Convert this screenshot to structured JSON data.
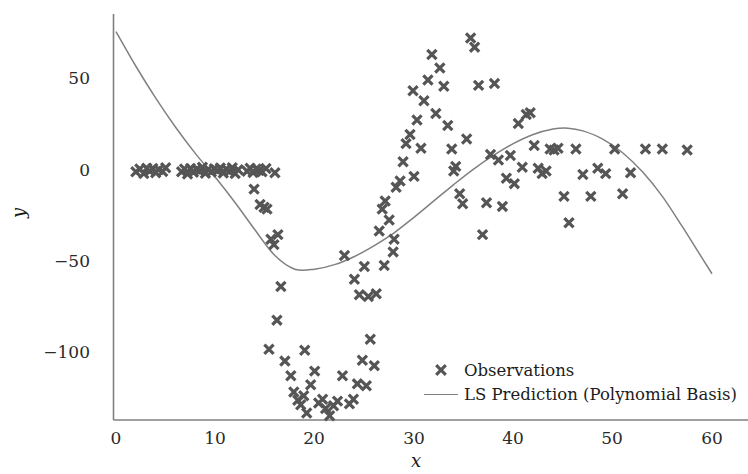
{
  "chart_data": {
    "type": "scatter",
    "title": "",
    "xlabel": "x",
    "ylabel": "y",
    "xlim": [
      -2.5,
      62
    ],
    "ylim": [
      -142,
      82
    ],
    "xticks": [
      0,
      10,
      20,
      30,
      40,
      50,
      60
    ],
    "xtick_labels": [
      "0",
      "10",
      "20",
      "30",
      "40",
      "50",
      "60"
    ],
    "yticks": [
      50,
      0,
      -50,
      -100
    ],
    "ytick_labels": [
      "50",
      "0",
      "−50",
      "−100"
    ],
    "grid": false,
    "legend_position": "lower right",
    "marker_color": "#555555",
    "line_color": "#808080",
    "axis_color": "#808080",
    "text_color": "#1c1c1c",
    "series": [
      {
        "name": "Observations",
        "type": "scatter",
        "marker": "x",
        "points": [
          [
            2.0,
            -1.0
          ],
          [
            2.4,
            0.5
          ],
          [
            2.8,
            -2.0
          ],
          [
            3.1,
            1.0
          ],
          [
            3.4,
            -0.5
          ],
          [
            3.7,
            0.8
          ],
          [
            4.0,
            -1.5
          ],
          [
            4.3,
            0.2
          ],
          [
            4.7,
            -0.8
          ],
          [
            5.0,
            1.2
          ],
          [
            6.6,
            -1.0
          ],
          [
            6.9,
            0.6
          ],
          [
            7.2,
            -2.2
          ],
          [
            7.5,
            0.9
          ],
          [
            7.8,
            -1.2
          ],
          [
            8.1,
            0.4
          ],
          [
            8.4,
            -0.6
          ],
          [
            8.7,
            1.5
          ],
          [
            9.0,
            -1.8
          ],
          [
            9.3,
            0.3
          ],
          [
            9.6,
            -1.1
          ],
          [
            9.9,
            0.7
          ],
          [
            10.2,
            -0.4
          ],
          [
            10.5,
            1.1
          ],
          [
            10.8,
            -1.6
          ],
          [
            11.1,
            0.5
          ],
          [
            11.4,
            -0.9
          ],
          [
            11.7,
            1.3
          ],
          [
            12.0,
            -2.0
          ],
          [
            12.3,
            0.1
          ],
          [
            13.2,
            -0.7
          ],
          [
            13.5,
            1.0
          ],
          [
            13.8,
            -1.4
          ],
          [
            14.1,
            0.6
          ],
          [
            14.4,
            -0.3
          ],
          [
            14.7,
            -1.0
          ],
          [
            15.1,
            0.8
          ],
          [
            16.0,
            -1.5
          ],
          [
            13.9,
            -10.5
          ],
          [
            14.5,
            -19.0
          ],
          [
            14.9,
            -20.5
          ],
          [
            15.2,
            -21.5
          ],
          [
            15.6,
            -38.0
          ],
          [
            15.9,
            -41.0
          ],
          [
            16.3,
            -35.5
          ],
          [
            16.6,
            -64.0
          ],
          [
            16.2,
            -82.5
          ],
          [
            15.4,
            -98.5
          ],
          [
            17.0,
            -105.0
          ],
          [
            17.6,
            -113.0
          ],
          [
            17.9,
            -122.0
          ],
          [
            18.3,
            -126.5
          ],
          [
            18.6,
            -129.0
          ],
          [
            18.9,
            -124.0
          ],
          [
            19.2,
            -133.5
          ],
          [
            19.6,
            -118.0
          ],
          [
            20.4,
            -128.0
          ],
          [
            20.8,
            -126.0
          ],
          [
            21.1,
            -131.0
          ],
          [
            21.5,
            -135.0
          ],
          [
            21.9,
            -129.5
          ],
          [
            22.3,
            -127.0
          ],
          [
            20.0,
            -110.5
          ],
          [
            22.8,
            -113.0
          ],
          [
            23.5,
            -128.5
          ],
          [
            23.9,
            -126.0
          ],
          [
            24.3,
            -117.5
          ],
          [
            19.0,
            -99.0
          ],
          [
            24.8,
            -104.5
          ],
          [
            25.2,
            -118.5
          ],
          [
            25.6,
            -93.0
          ],
          [
            26.0,
            -107.5
          ],
          [
            23.0,
            -47.0
          ],
          [
            24.0,
            -60.0
          ],
          [
            24.5,
            -68.5
          ],
          [
            25.4,
            -69.5
          ],
          [
            25.0,
            -53.0
          ],
          [
            26.5,
            -33.5
          ],
          [
            26.8,
            -21.5
          ],
          [
            27.1,
            -17.0
          ],
          [
            27.5,
            -27.5
          ],
          [
            27.9,
            -45.0
          ],
          [
            28.2,
            -9.5
          ],
          [
            28.6,
            -6.0
          ],
          [
            28.9,
            4.5
          ],
          [
            29.2,
            14.5
          ],
          [
            29.6,
            19.5
          ],
          [
            29.9,
            43.5
          ],
          [
            30.3,
            27.5
          ],
          [
            30.7,
            12.0
          ],
          [
            31.0,
            38.0
          ],
          [
            31.4,
            49.5
          ],
          [
            31.8,
            63.5
          ],
          [
            32.2,
            31.0
          ],
          [
            32.6,
            56.0
          ],
          [
            33.0,
            46.0
          ],
          [
            33.4,
            24.5
          ],
          [
            33.8,
            11.5
          ],
          [
            34.2,
            2.0
          ],
          [
            34.6,
            -13.0
          ],
          [
            34.9,
            -18.5
          ],
          [
            35.3,
            17.0
          ],
          [
            35.7,
            72.5
          ],
          [
            36.1,
            67.5
          ],
          [
            36.5,
            46.5
          ],
          [
            36.9,
            -35.5
          ],
          [
            37.3,
            -18.0
          ],
          [
            37.7,
            8.5
          ],
          [
            38.1,
            47.5
          ],
          [
            38.5,
            5.5
          ],
          [
            38.9,
            -20.0
          ],
          [
            39.3,
            -4.5
          ],
          [
            39.7,
            8.0
          ],
          [
            40.1,
            -7.5
          ],
          [
            40.5,
            25.5
          ],
          [
            40.9,
            1.5
          ],
          [
            41.3,
            30.5
          ],
          [
            41.7,
            31.5
          ],
          [
            42.1,
            13.5
          ],
          [
            42.5,
            1.0
          ],
          [
            42.9,
            -2.0
          ],
          [
            43.3,
            -0.5
          ],
          [
            43.7,
            11.5
          ],
          [
            44.1,
            11.0
          ],
          [
            44.5,
            12.0
          ],
          [
            45.1,
            -14.5
          ],
          [
            45.6,
            -29.0
          ],
          [
            46.3,
            11.5
          ],
          [
            47.0,
            -2.5
          ],
          [
            47.8,
            -14.5
          ],
          [
            48.5,
            1.0
          ],
          [
            49.3,
            -2.0
          ],
          [
            50.2,
            11.5
          ],
          [
            51.0,
            -13.0
          ],
          [
            51.8,
            -1.5
          ],
          [
            53.3,
            11.5
          ],
          [
            55.0,
            11.5
          ],
          [
            57.5,
            11.0
          ],
          [
            34.0,
            -0.5
          ],
          [
            30.0,
            -3.5
          ],
          [
            28.0,
            -38.0
          ],
          [
            27.0,
            -52.5
          ],
          [
            26.2,
            -68.0
          ]
        ]
      },
      {
        "name": "LS Prediction (Polynomial Basis)",
        "type": "line",
        "curve_points": [
          [
            0.0,
            76.0
          ],
          [
            2.0,
            57.0
          ],
          [
            4.0,
            39.5
          ],
          [
            6.0,
            23.5
          ],
          [
            8.0,
            9.0
          ],
          [
            10.0,
            -4.0
          ],
          [
            12.0,
            -18.0
          ],
          [
            14.0,
            -33.0
          ],
          [
            16.0,
            -47.0
          ],
          [
            18.0,
            -54.5
          ],
          [
            20.0,
            -54.5
          ],
          [
            22.0,
            -52.0
          ],
          [
            24.0,
            -47.5
          ],
          [
            26.0,
            -41.5
          ],
          [
            28.0,
            -34.5
          ],
          [
            30.0,
            -26.0
          ],
          [
            32.0,
            -17.0
          ],
          [
            34.0,
            -8.0
          ],
          [
            36.0,
            0.5
          ],
          [
            38.0,
            8.0
          ],
          [
            40.0,
            14.5
          ],
          [
            42.0,
            19.5
          ],
          [
            44.0,
            22.5
          ],
          [
            45.5,
            23.0
          ],
          [
            47.0,
            21.5
          ],
          [
            49.0,
            17.0
          ],
          [
            51.0,
            9.5
          ],
          [
            53.0,
            -1.0
          ],
          [
            55.0,
            -14.5
          ],
          [
            57.0,
            -31.0
          ],
          [
            58.5,
            -44.0
          ],
          [
            60.0,
            -57.0
          ]
        ]
      }
    ]
  },
  "legend": {
    "entries": [
      {
        "label": "Observations",
        "key": "marker-x"
      },
      {
        "label": "LS Prediction (Polynomial Basis)",
        "key": "line"
      }
    ]
  },
  "axes": {
    "x_title": "x",
    "y_title": "y"
  }
}
